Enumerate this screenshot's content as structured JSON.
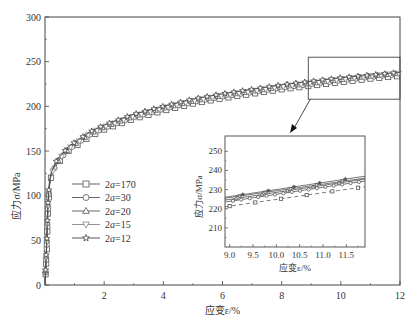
{
  "chart_data": [
    {
      "id": "main",
      "type": "line",
      "title": "",
      "xlabel": "应变ε/%",
      "ylabel": "应力σ/MPa",
      "xlim": [
        0,
        12
      ],
      "ylim": [
        0,
        300
      ],
      "xticks": [
        "2",
        "4",
        "6",
        "8",
        "10",
        "12"
      ],
      "xtick_values": [
        2,
        4,
        6,
        8,
        10,
        12
      ],
      "yticks": [
        "0",
        "50",
        "100",
        "150",
        "200",
        "250",
        "300"
      ],
      "ytick_values": [
        0,
        50,
        100,
        150,
        200,
        250,
        300
      ],
      "grid": false,
      "legend_position": "center-left",
      "series": [
        {
          "name": "2a=170",
          "label_prefix": "2",
          "label_var": "a",
          "label_suffix": "=170",
          "marker": "square",
          "color": "#555555",
          "x": [
            0,
            0.05,
            0.1,
            0.15,
            0.2,
            0.4,
            0.8,
            1.5,
            2,
            3,
            4,
            5,
            6,
            7,
            8,
            9,
            10,
            11,
            12
          ],
          "y": [
            0,
            30,
            80,
            110,
            120,
            135,
            150,
            166,
            174,
            186,
            195,
            203,
            209,
            214,
            219,
            223,
            227,
            231,
            234
          ]
        },
        {
          "name": "2a=30",
          "label_prefix": "2",
          "label_var": "a",
          "label_suffix": "=30",
          "marker": "circle",
          "color": "#555555",
          "x": [
            0,
            0.05,
            0.1,
            0.15,
            0.2,
            0.4,
            0.8,
            1.5,
            2,
            3,
            4,
            5,
            6,
            7,
            8,
            9,
            10,
            11,
            12
          ],
          "y": [
            0,
            35,
            85,
            112,
            122,
            137,
            152,
            168,
            176,
            188,
            197,
            205,
            211,
            216,
            221,
            225,
            229,
            233,
            236
          ]
        },
        {
          "name": "2a=20",
          "label_prefix": "2",
          "label_var": "a",
          "label_suffix": "=20",
          "marker": "triangle-up",
          "color": "#555555",
          "x": [
            0,
            0.05,
            0.1,
            0.15,
            0.2,
            0.4,
            0.8,
            1.5,
            2,
            3,
            4,
            5,
            6,
            7,
            8,
            9,
            10,
            11,
            12
          ],
          "y": [
            0,
            40,
            90,
            114,
            123,
            138,
            153,
            169,
            177,
            189,
            198,
            206,
            212,
            217,
            222,
            226,
            230,
            234,
            237
          ]
        },
        {
          "name": "2a=15",
          "label_prefix": "2",
          "label_var": "a",
          "label_suffix": "=15",
          "marker": "triangle-down",
          "color": "#888888",
          "x": [
            0,
            0.05,
            0.1,
            0.15,
            0.2,
            0.4,
            0.8,
            1.5,
            2,
            3,
            4,
            5,
            6,
            7,
            8,
            9,
            10,
            11,
            12
          ],
          "y": [
            0,
            38,
            88,
            113,
            123,
            138,
            153,
            169,
            177,
            189,
            198,
            206,
            212,
            217,
            222,
            226,
            230,
            234,
            237
          ]
        },
        {
          "name": "2a=12",
          "label_prefix": "2",
          "label_var": "a",
          "label_suffix": "=12",
          "marker": "star",
          "color": "#444444",
          "x": [
            0,
            0.05,
            0.1,
            0.15,
            0.2,
            0.4,
            0.8,
            1.5,
            2,
            3,
            4,
            5,
            6,
            7,
            8,
            9,
            10,
            11,
            12
          ],
          "y": [
            0,
            42,
            92,
            116,
            125,
            140,
            155,
            171,
            179,
            191,
            200,
            208,
            214,
            219,
            224,
            228,
            232,
            235,
            238
          ]
        }
      ],
      "annotations": [
        {
          "type": "zoom-box",
          "x_range": [
            8.9,
            12
          ],
          "y_range": [
            208,
            255
          ]
        },
        {
          "type": "arrow",
          "from": "zoom-box",
          "to": "inset"
        }
      ]
    },
    {
      "id": "inset",
      "type": "line",
      "title": "",
      "xlabel": "应变ε/%",
      "ylabel": "应力σ/MPa",
      "xlim": [
        8.9,
        11.9
      ],
      "ylim": [
        200,
        258
      ],
      "xticks": [
        "9.0",
        "9.5",
        "10.0",
        "10.5",
        "11.0",
        "11.5"
      ],
      "xtick_values": [
        9.0,
        9.5,
        10.0,
        10.5,
        11.0,
        11.5
      ],
      "yticks": [
        "210",
        "220",
        "230",
        "240",
        "250"
      ],
      "ytick_values": [
        210,
        220,
        230,
        240,
        250
      ],
      "grid": false,
      "series": [
        {
          "name": "2a=170",
          "style": "dashed",
          "x": [
            8.9,
            11.9
          ],
          "y": [
            221,
            231.5
          ]
        },
        {
          "name": "2a=30",
          "style": "solid",
          "x": [
            8.9,
            11.9
          ],
          "y": [
            223.5,
            234.5
          ]
        },
        {
          "name": "2a=20",
          "style": "solid",
          "x": [
            8.9,
            11.9
          ],
          "y": [
            224.5,
            235.5
          ]
        },
        {
          "name": "2a=15",
          "style": "solid",
          "x": [
            8.9,
            11.9
          ],
          "y": [
            225.5,
            236
          ]
        },
        {
          "name": "2a=12",
          "style": "solid",
          "x": [
            8.9,
            11.9
          ],
          "y": [
            226,
            237
          ]
        }
      ]
    }
  ]
}
